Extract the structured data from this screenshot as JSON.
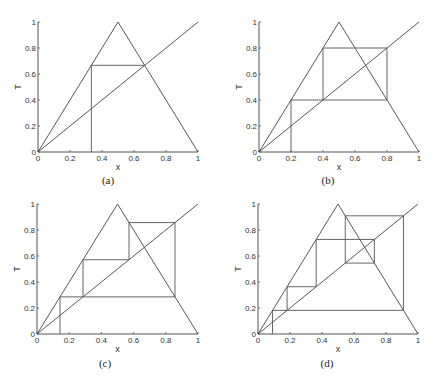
{
  "figure": {
    "panels": [
      {
        "id": "a",
        "caption": "(a)"
      },
      {
        "id": "b",
        "caption": "(b)"
      },
      {
        "id": "c",
        "caption": "(c)"
      },
      {
        "id": "d",
        "caption": "(d)"
      }
    ]
  },
  "chart_data": [
    {
      "type": "line",
      "panel": "(a)",
      "title": "",
      "xlabel": "x",
      "ylabel": "T",
      "xlim": [
        0,
        1
      ],
      "ylim": [
        0,
        1
      ],
      "xticks": [
        "0",
        "0.2",
        "0.4",
        "0.6",
        "0.8",
        "1"
      ],
      "yticks": [
        "0",
        "0.2",
        "0.4",
        "0.6",
        "0.8",
        "1"
      ],
      "grid": false,
      "series": [
        {
          "name": "tent map T(x)",
          "x": [
            0,
            0.5,
            1
          ],
          "y": [
            0,
            1,
            0
          ]
        },
        {
          "name": "diagonal y=x",
          "x": [
            0,
            1
          ],
          "y": [
            0,
            1
          ]
        },
        {
          "name": "orbit (period 2 hits fixed point)",
          "x": [
            0.3333,
            0.3333,
            0.6667
          ],
          "y": [
            0,
            0.6667,
            0.6667
          ]
        }
      ]
    },
    {
      "type": "line",
      "panel": "(b)",
      "title": "",
      "xlabel": "x",
      "ylabel": "T",
      "xlim": [
        0,
        1
      ],
      "ylim": [
        0,
        1
      ],
      "xticks": [
        "0",
        "0.2",
        "0.4",
        "0.6",
        "0.8",
        "1"
      ],
      "yticks": [
        "0",
        "0.2",
        "0.4",
        "0.6",
        "0.8",
        "1"
      ],
      "grid": false,
      "series": [
        {
          "name": "tent map T(x)",
          "x": [
            0,
            0.5,
            1
          ],
          "y": [
            0,
            1,
            0
          ]
        },
        {
          "name": "diagonal y=x",
          "x": [
            0,
            1
          ],
          "y": [
            0,
            1
          ]
        },
        {
          "name": "orbit (period 2)",
          "x": [
            0.2,
            0.2,
            0.4,
            0.4,
            0.8,
            0.8,
            0.4
          ],
          "y": [
            0,
            0.4,
            0.4,
            0.8,
            0.8,
            0.4,
            0.4
          ]
        }
      ]
    },
    {
      "type": "line",
      "panel": "(c)",
      "title": "",
      "xlabel": "x",
      "ylabel": "T",
      "xlim": [
        0,
        1
      ],
      "ylim": [
        0,
        1
      ],
      "xticks": [
        "0",
        "0.2",
        "0.4",
        "0.6",
        "0.8",
        "1"
      ],
      "yticks": [
        "0",
        "0.2",
        "0.4",
        "0.6",
        "0.8",
        "1"
      ],
      "grid": false,
      "series": [
        {
          "name": "tent map T(x)",
          "x": [
            0,
            0.5,
            1
          ],
          "y": [
            0,
            1,
            0
          ]
        },
        {
          "name": "diagonal y=x",
          "x": [
            0,
            1
          ],
          "y": [
            0,
            1
          ]
        },
        {
          "name": "orbit (period 3)",
          "x": [
            0.1429,
            0.1429,
            0.2857,
            0.2857,
            0.5714,
            0.5714,
            0.8571,
            0.8571,
            0.2857
          ],
          "y": [
            0,
            0.2857,
            0.2857,
            0.5714,
            0.5714,
            0.8571,
            0.8571,
            0.2857,
            0.2857
          ]
        }
      ]
    },
    {
      "type": "line",
      "panel": "(d)",
      "title": "",
      "xlabel": "x",
      "ylabel": "T",
      "xlim": [
        0,
        1
      ],
      "ylim": [
        0,
        1
      ],
      "xticks": [
        "0",
        "0.2",
        "0.4",
        "0.6",
        "0.8",
        "1"
      ],
      "yticks": [
        "0",
        "0.2",
        "0.4",
        "0.6",
        "0.8",
        "1"
      ],
      "grid": false,
      "series": [
        {
          "name": "tent map T(x)",
          "x": [
            0,
            0.5,
            1
          ],
          "y": [
            0,
            1,
            0
          ]
        },
        {
          "name": "diagonal y=x",
          "x": [
            0,
            1
          ],
          "y": [
            0,
            1
          ]
        },
        {
          "name": "orbit (period 5)",
          "x": [
            0.0909,
            0.0909,
            0.1818,
            0.1818,
            0.3636,
            0.3636,
            0.7273,
            0.7273,
            0.5455,
            0.5455,
            0.9091,
            0.9091,
            0.1818
          ],
          "y": [
            0,
            0.1818,
            0.1818,
            0.3636,
            0.3636,
            0.7273,
            0.7273,
            0.5455,
            0.5455,
            0.9091,
            0.9091,
            0.1818,
            0.1818
          ]
        }
      ]
    }
  ]
}
